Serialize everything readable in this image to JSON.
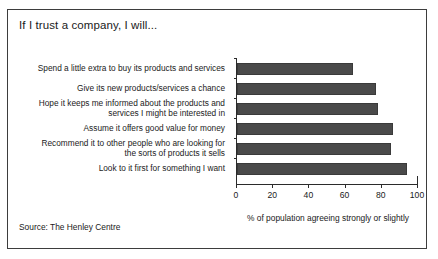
{
  "figure": {
    "title": "If I trust a company, I will...",
    "source": "Source: The Henley Centre",
    "border_color": "#3d3d3d",
    "background": "#ffffff"
  },
  "chart_data": {
    "type": "bar",
    "orientation": "horizontal",
    "title": "If I trust a company, I will...",
    "xlabel": "% of population agreeing strongly or slightly",
    "ylabel": "",
    "xlim": [
      0,
      100
    ],
    "xticks": [
      0,
      20,
      40,
      60,
      80,
      100
    ],
    "grid": false,
    "legend": null,
    "bar_color": "#4a4a4a",
    "categories": [
      "Spend a little extra to buy its products and services",
      "Give its new products/services a chance",
      "Hope it keeps me informed about the products and\nservices I might be interested in",
      "Assume it offers good value for money",
      "Recommend it to other people who are looking for\nthe sorts of products it sells",
      "Look to it first for something I want"
    ],
    "values": [
      64,
      77,
      78,
      86,
      85,
      94
    ]
  }
}
